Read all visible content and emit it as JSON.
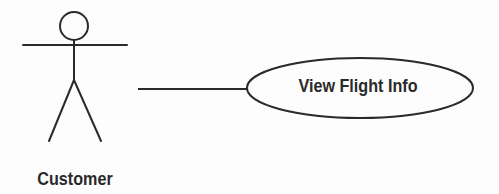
{
  "diagram": {
    "type": "uml-use-case",
    "actor": {
      "name": "Customer"
    },
    "use_case": {
      "name": "View Flight Info"
    },
    "association": {
      "from": "Customer",
      "to": "View Flight Info"
    },
    "colors": {
      "stroke": "#2a2a2a",
      "background": "#fdfdfd"
    }
  }
}
